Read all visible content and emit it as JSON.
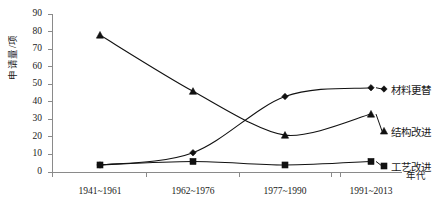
{
  "chart_data": {
    "type": "line",
    "title": "",
    "xlabel": "年代",
    "ylabel": "申请量/项",
    "categories": [
      "1941~1961",
      "1962~1976",
      "1977~1990",
      "1991~2013"
    ],
    "ylim": [
      0,
      90
    ],
    "ytick_values": [
      "0",
      "10",
      "20",
      "30",
      "40",
      "50",
      "60",
      "70",
      "80",
      "90"
    ],
    "grid": false,
    "legend_position": "right-inline-labels",
    "series": [
      {
        "name": "材料更替",
        "marker": "diamond",
        "values": [
          4,
          11,
          43,
          48
        ]
      },
      {
        "name": "结构改进",
        "marker": "triangle",
        "values": [
          78,
          46,
          21,
          33
        ]
      },
      {
        "name": "工艺改进",
        "marker": "square",
        "values": [
          4,
          6,
          4,
          6
        ]
      }
    ]
  },
  "axis": {
    "y_label": "申请量/项",
    "x_label": "年代",
    "y_ticks": [
      "90",
      "80",
      "70",
      "60",
      "50",
      "40",
      "30",
      "20",
      "10",
      "0"
    ],
    "x_ticks": [
      "1941~1961",
      "1962~1976",
      "1977~1990",
      "1991~2013"
    ]
  },
  "series_labels": {
    "material": "材料更替",
    "structure": "结构改进",
    "process": "工艺改进"
  }
}
